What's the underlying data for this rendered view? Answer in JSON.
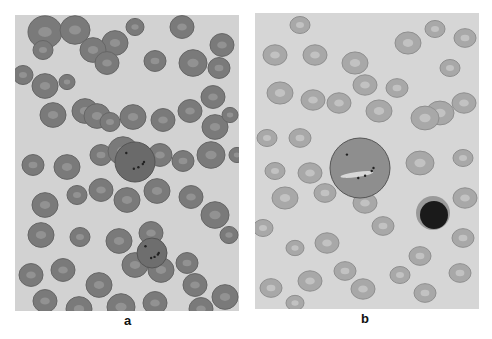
{
  "figure": {
    "panels": [
      {
        "id": "a",
        "label": "a",
        "description": "Blood smear: densely packed, darker red cells with a large basophilic-stippled cell near center",
        "background": "#d2d2d2",
        "cell_color": "#7a7a7a",
        "cells": [
          [
            30,
            17,
            17
          ],
          [
            60,
            15,
            15
          ],
          [
            100,
            28,
            13
          ],
          [
            120,
            12,
            9
          ],
          [
            167,
            12,
            12
          ],
          [
            207,
            30,
            12
          ],
          [
            28,
            35,
            10
          ],
          [
            78,
            35,
            13
          ],
          [
            92,
            48,
            12
          ],
          [
            140,
            46,
            11
          ],
          [
            178,
            48,
            14
          ],
          [
            204,
            53,
            11
          ],
          [
            8,
            60,
            10
          ],
          [
            30,
            71,
            13
          ],
          [
            52,
            67,
            8
          ],
          [
            70,
            96,
            13
          ],
          [
            38,
            100,
            13
          ],
          [
            82,
            101,
            13
          ],
          [
            118,
            102,
            13
          ],
          [
            148,
            105,
            12
          ],
          [
            175,
            96,
            12
          ],
          [
            198,
            82,
            12
          ],
          [
            200,
            112,
            13
          ],
          [
            215,
            100,
            8
          ],
          [
            95,
            107,
            10
          ],
          [
            18,
            150,
            11
          ],
          [
            52,
            152,
            13
          ],
          [
            86,
            140,
            11
          ],
          [
            108,
            136,
            15
          ],
          [
            145,
            140,
            12
          ],
          [
            168,
            146,
            11
          ],
          [
            196,
            140,
            14
          ],
          [
            222,
            140,
            8
          ],
          [
            30,
            190,
            13
          ],
          [
            62,
            180,
            10
          ],
          [
            86,
            175,
            12
          ],
          [
            112,
            185,
            13
          ],
          [
            142,
            176,
            13
          ],
          [
            176,
            182,
            12
          ],
          [
            200,
            200,
            14
          ],
          [
            26,
            220,
            13
          ],
          [
            65,
            222,
            10
          ],
          [
            104,
            226,
            13
          ],
          [
            136,
            218,
            12
          ],
          [
            172,
            248,
            11
          ],
          [
            214,
            220,
            9
          ],
          [
            16,
            260,
            12
          ],
          [
            48,
            255,
            12
          ],
          [
            84,
            270,
            13
          ],
          [
            120,
            250,
            13
          ],
          [
            146,
            255,
            13
          ],
          [
            180,
            270,
            12
          ],
          [
            210,
            282,
            13
          ],
          [
            30,
            286,
            12
          ],
          [
            64,
            294,
            13
          ],
          [
            106,
            292,
            14
          ],
          [
            140,
            288,
            12
          ],
          [
            186,
            294,
            12
          ]
        ],
        "special_cells": [
          {
            "type": "stippled-large-cell",
            "x": 120,
            "y": 147,
            "r": 20,
            "color": "#6a6a6a"
          },
          {
            "type": "stippled-cell",
            "x": 137,
            "y": 238,
            "r": 15,
            "color": "#6e6e6e"
          }
        ]
      },
      {
        "id": "b",
        "label": "b",
        "description": "Blood smear: paler oval red cells, a large cell with inclusions, and a dark-nucleated lymphocyte",
        "background": "#d6d6d6",
        "cell_color": "#a8a8a8",
        "cells": [
          [
            45,
            12,
            10
          ],
          [
            20,
            42,
            12
          ],
          [
            60,
            42,
            12
          ],
          [
            180,
            16,
            10
          ],
          [
            210,
            25,
            11
          ],
          [
            25,
            80,
            13
          ],
          [
            58,
            87,
            12
          ],
          [
            100,
            50,
            13
          ],
          [
            153,
            30,
            13
          ],
          [
            195,
            55,
            10
          ],
          [
            110,
            72,
            12
          ],
          [
            142,
            75,
            11
          ],
          [
            185,
            100,
            14
          ],
          [
            12,
            125,
            10
          ],
          [
            45,
            125,
            11
          ],
          [
            84,
            90,
            12
          ],
          [
            124,
            98,
            13
          ],
          [
            170,
            105,
            14
          ],
          [
            209,
            90,
            12
          ],
          [
            20,
            158,
            10
          ],
          [
            55,
            160,
            12
          ],
          [
            96,
            155,
            12
          ],
          [
            165,
            150,
            14
          ],
          [
            208,
            145,
            10
          ],
          [
            30,
            185,
            13
          ],
          [
            70,
            180,
            11
          ],
          [
            110,
            190,
            12
          ],
          [
            210,
            185,
            12
          ],
          [
            8,
            215,
            10
          ],
          [
            40,
            235,
            9
          ],
          [
            72,
            230,
            12
          ],
          [
            128,
            213,
            11
          ],
          [
            165,
            243,
            11
          ],
          [
            208,
            225,
            11
          ],
          [
            16,
            275,
            11
          ],
          [
            55,
            268,
            12
          ],
          [
            90,
            258,
            11
          ],
          [
            108,
            276,
            12
          ],
          [
            145,
            262,
            10
          ],
          [
            170,
            280,
            11
          ],
          [
            205,
            260,
            11
          ],
          [
            40,
            290,
            9
          ]
        ],
        "special_cells": [
          {
            "type": "large-cell-with-inclusions",
            "x": 105,
            "y": 155,
            "r": 30,
            "color": "#8e8e8e"
          },
          {
            "type": "lymphocyte",
            "x": 178,
            "y": 200,
            "r": 17,
            "color": "#1a1a1a",
            "rim_color": "#9a9a9a"
          }
        ]
      }
    ]
  }
}
